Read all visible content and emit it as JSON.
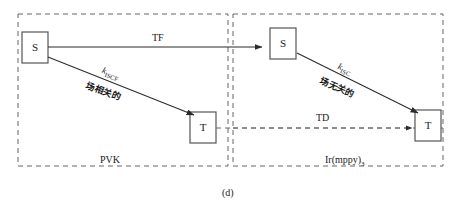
{
  "figure": {
    "caption": "(d)",
    "panels": [
      {
        "id": "left",
        "material": "PVK",
        "states": {
          "singlet": "S",
          "triplet": "T"
        },
        "arrows": [
          {
            "name": "energy-transfer",
            "label": "TF"
          },
          {
            "name": "intersystem-crossing",
            "label": "k",
            "sublabel": "ISCF",
            "annotation": "场相关的"
          }
        ]
      },
      {
        "id": "right",
        "material": "Ir(mppy)",
        "material_sub": "3",
        "states": {
          "singlet": "S",
          "triplet": "T"
        },
        "arrows": [
          {
            "name": "triplet-diffusion",
            "label": "TD"
          },
          {
            "name": "intersystem-crossing",
            "label": "k",
            "sublabel": "ISC",
            "annotation": "场无关的"
          }
        ]
      }
    ]
  },
  "colors": {
    "line": "#3a3a3a",
    "box_border": "#555555",
    "dashed_border": "#666666",
    "text": "#1a1a1a",
    "background": "#ffffff"
  }
}
